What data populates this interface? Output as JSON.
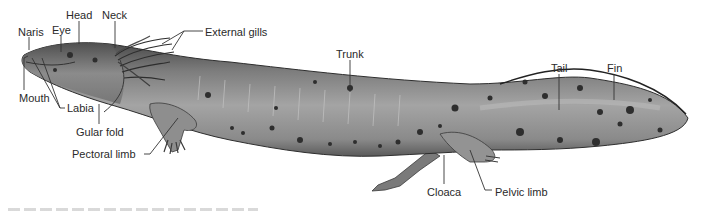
{
  "figure": {
    "colors": {
      "background": "#ffffff",
      "body_mid": "#8c8c8c",
      "body_dark": "#555555",
      "spot": "#2e2e2e",
      "leader": "#333333",
      "text": "#2a2a2a"
    }
  },
  "labels": [
    {
      "id": "naris",
      "text": "Naris",
      "x": 18,
      "y": 26
    },
    {
      "id": "eye",
      "text": "Eye",
      "x": 52,
      "y": 24
    },
    {
      "id": "head",
      "text": "Head",
      "x": 66,
      "y": 9
    },
    {
      "id": "neck",
      "text": "Neck",
      "x": 102,
      "y": 9
    },
    {
      "id": "external-gills",
      "text": "External gills",
      "x": 205,
      "y": 26
    },
    {
      "id": "trunk",
      "text": "Trunk",
      "x": 336,
      "y": 48
    },
    {
      "id": "tail",
      "text": "Tail",
      "x": 551,
      "y": 62
    },
    {
      "id": "fin",
      "text": "Fin",
      "x": 607,
      "y": 62
    },
    {
      "id": "mouth",
      "text": "Mouth",
      "x": 19,
      "y": 92
    },
    {
      "id": "labia",
      "text": "Labia",
      "x": 67,
      "y": 104
    },
    {
      "id": "gular-fold",
      "text": "Gular fold",
      "x": 76,
      "y": 127
    },
    {
      "id": "pectoral-limb",
      "text": "Pectoral limb",
      "x": 72,
      "y": 149
    },
    {
      "id": "cloaca",
      "text": "Cloaca",
      "x": 427,
      "y": 186
    },
    {
      "id": "pelvic-limb",
      "text": "Pelvic limb",
      "x": 494,
      "y": 186
    }
  ]
}
